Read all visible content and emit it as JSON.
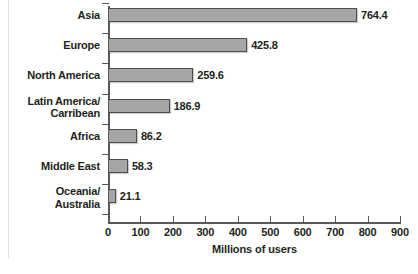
{
  "chart_data": {
    "type": "bar",
    "orientation": "horizontal",
    "title": "",
    "xlabel": "Millions of users",
    "ylabel": "",
    "xlim": [
      0,
      900
    ],
    "grid": false,
    "legend": null,
    "categories": [
      "Asia",
      "Europe",
      "North America",
      "Latin America/\nCarribean",
      "Africa",
      "Middle East",
      "Oceania/\nAustralia"
    ],
    "values": [
      764.4,
      425.8,
      259.6,
      186.9,
      86.2,
      58.3,
      21.1
    ],
    "value_labels": [
      "764.4",
      "425.8",
      "259.6",
      "186.9",
      "86.2",
      "58.3",
      "21.1"
    ],
    "xticks": [
      0,
      100,
      200,
      300,
      400,
      500,
      600,
      700,
      800,
      900
    ],
    "xticklabels": [
      "0",
      "100",
      "200",
      "300",
      "400",
      "500",
      "600",
      "700",
      "800",
      "900"
    ],
    "bar_color": "#a6a6a6",
    "bar_edge_color": "#4d4d4f",
    "text_color": "#231f20",
    "axis_color": "#58585a",
    "background": "#ffffff"
  },
  "rows": [
    {
      "label_line1": "Asia",
      "label_line2": "",
      "value_label": "764.4"
    },
    {
      "label_line1": "Europe",
      "label_line2": "",
      "value_label": "425.8"
    },
    {
      "label_line1": "North America",
      "label_line2": "",
      "value_label": "259.6"
    },
    {
      "label_line1": "Latin America/",
      "label_line2": "Carribean",
      "value_label": "186.9"
    },
    {
      "label_line1": "Africa",
      "label_line2": "",
      "value_label": "86.2"
    },
    {
      "label_line1": "Middle East",
      "label_line2": "",
      "value_label": "58.3"
    },
    {
      "label_line1": "Oceania/",
      "label_line2": "Australia",
      "value_label": "21.1"
    }
  ],
  "axis": {
    "title": "Millions of users",
    "ticklabels": [
      "0",
      "100",
      "200",
      "300",
      "400",
      "500",
      "600",
      "700",
      "800",
      "900"
    ]
  },
  "caption": ""
}
